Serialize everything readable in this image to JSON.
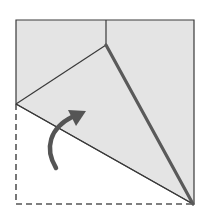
{
  "diagram": {
    "type": "origami-fold-step",
    "colors": {
      "paper": "#e4e4e4",
      "line": "#3a3a3a",
      "thick_crease": "#5a5a5a",
      "dashed_outline": "#555555",
      "arrow": "#555555",
      "background": "#ffffff"
    },
    "square": {
      "left": 16,
      "top": 20,
      "right": 194,
      "bottom": 204
    },
    "points": {
      "top_crease": [
        106,
        20
      ],
      "inner_corner": [
        106,
        45
      ],
      "left_fold": [
        16,
        104
      ],
      "bottom_right": [
        193,
        204
      ]
    },
    "arrow": {
      "semantic": "fold-up-arrow",
      "path": "M56,168 C44,148 50,128 72,117",
      "head": [
        85,
        111
      ]
    }
  }
}
